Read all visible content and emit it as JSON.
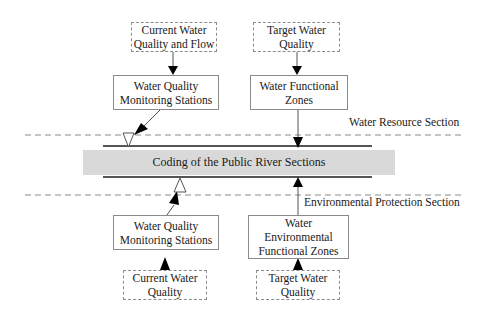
{
  "diagram": {
    "center_band": {
      "label": "Coding of the Public River Sections",
      "fill": "#d9d9d9"
    },
    "section_labels": {
      "water_resource": "Water Resource Section",
      "environmental_protection": "Environmental Protection Section"
    },
    "top_left": {
      "source": "Current Water\nQuality and Flow",
      "node": "Water Quality\nMonitoring Stations"
    },
    "top_right": {
      "source": "Target Water\nQuality",
      "node": "Water Functional\nZones"
    },
    "bottom_left": {
      "node": "Water Quality\nMonitoring Stations",
      "source": "Current Water\nQuality"
    },
    "bottom_right": {
      "node": "Water\nEnvironmental\nFunctional Zones",
      "source": "Target Water\nQuality"
    }
  }
}
